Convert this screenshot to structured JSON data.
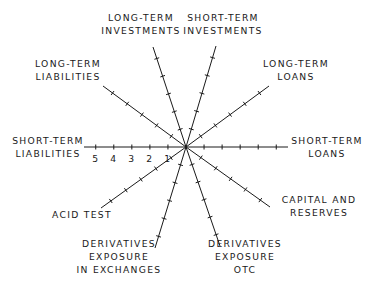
{
  "diagram": {
    "type": "radar-axes",
    "center": [
      186,
      147
    ],
    "colors": {
      "ink": "#1a1a1a",
      "background": "#ffffff"
    },
    "scale_labels": [
      "1",
      "2",
      "3",
      "4",
      "5"
    ],
    "axes": [
      {
        "id": "short-term-liabilities",
        "label_lines": [
          "SHORT-TERM",
          "LIABILITIES"
        ],
        "end": [
          84,
          147
        ],
        "label_pos": [
          48,
          147
        ],
        "anchor": "middle"
      },
      {
        "id": "long-term-liabilities",
        "label_lines": [
          "LONG-TERM",
          "LIABILITIES"
        ],
        "end": [
          103,
          86
        ],
        "label_pos": [
          68,
          70
        ],
        "anchor": "middle"
      },
      {
        "id": "long-term-investments",
        "label_lines": [
          "LONG-TERM",
          "INVESTMENTS"
        ],
        "end": [
          153,
          47
        ],
        "label_pos": [
          141,
          24
        ],
        "anchor": "middle"
      },
      {
        "id": "short-term-investments",
        "label_lines": [
          "SHORT-TERM",
          "INVESTMENTS"
        ],
        "end": [
          216,
          46
        ],
        "label_pos": [
          223,
          24
        ],
        "anchor": "middle"
      },
      {
        "id": "long-term-loans",
        "label_lines": [
          "LONG-TERM",
          "LOANS"
        ],
        "end": [
          269,
          86
        ],
        "label_pos": [
          296,
          70
        ],
        "anchor": "middle"
      },
      {
        "id": "short-term-loans",
        "label_lines": [
          "SHORT-TERM",
          "LOANS"
        ],
        "end": [
          288,
          147
        ],
        "label_pos": [
          327,
          147
        ],
        "anchor": "middle"
      },
      {
        "id": "capital-and-reserves",
        "label_lines": [
          "CAPITAL AND",
          "RESERVES"
        ],
        "end": [
          270,
          207
        ],
        "label_pos": [
          319,
          206
        ],
        "anchor": "middle"
      },
      {
        "id": "derivatives-exposure-otc",
        "label_lines": [
          "DERIVATIVES",
          "EXPOSURE",
          "OTC"
        ],
        "end": [
          220,
          246
        ],
        "label_pos": [
          245,
          257
        ],
        "anchor": "middle"
      },
      {
        "id": "derivatives-exposure-in-exchanges",
        "label_lines": [
          "DERIVATIVES",
          "EXPOSURE",
          "IN EXCHANGES"
        ],
        "end": [
          155,
          248
        ],
        "label_pos": [
          119,
          257
        ],
        "anchor": "middle"
      },
      {
        "id": "acid-test",
        "label_lines": [
          "ACID TEST"
        ],
        "end": [
          101,
          208
        ],
        "label_pos": [
          82,
          215
        ],
        "anchor": "middle"
      }
    ]
  },
  "chart_data": {
    "type": "radar",
    "title": "",
    "categories": [
      "SHORT-TERM LIABILITIES",
      "LONG-TERM LIABILITIES",
      "LONG-TERM INVESTMENTS",
      "SHORT-TERM INVESTMENTS",
      "LONG-TERM LOANS",
      "SHORT-TERM LOANS",
      "CAPITAL AND RESERVES",
      "DERIVATIVES EXPOSURE OTC",
      "DERIVATIVES EXPOSURE IN EXCHANGES",
      "ACID TEST"
    ],
    "scale_ticks": [
      1,
      2,
      3,
      4,
      5
    ],
    "range": [
      0,
      5
    ],
    "series": [],
    "grid": false,
    "legend": "none"
  }
}
